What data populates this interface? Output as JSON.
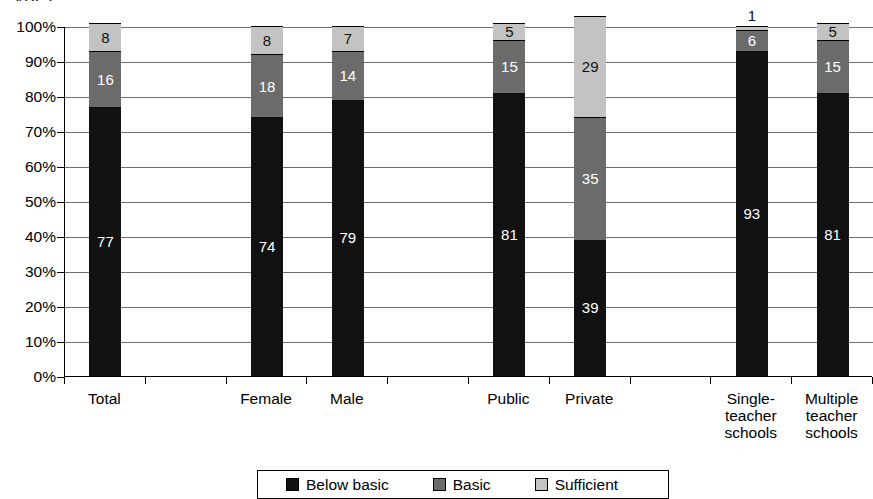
{
  "title_fragment": "ype)",
  "chart_data": {
    "type": "bar",
    "subtype": "stacked-100-percent",
    "title": "",
    "xlabel": "",
    "ylabel": "",
    "ylim": [
      0,
      100
    ],
    "ytick_labels": [
      "100%",
      "90%",
      "80%",
      "70%",
      "60%",
      "50%",
      "40%",
      "30%",
      "20%",
      "10%",
      "0%"
    ],
    "ytick_values": [
      100,
      90,
      80,
      70,
      60,
      50,
      40,
      30,
      20,
      10,
      0
    ],
    "grid": true,
    "legend_position": "bottom",
    "categories": [
      "Total",
      "Female",
      "Male",
      "Public",
      "Private",
      "Single-teacher schools",
      "Multiple teacher schools"
    ],
    "category_lines": [
      [
        "Total"
      ],
      [
        "Female"
      ],
      [
        "Male"
      ],
      [
        "Public"
      ],
      [
        "Private"
      ],
      [
        "Single-",
        "teacher",
        "schools"
      ],
      [
        "Multiple",
        "teacher",
        "schools"
      ]
    ],
    "series": [
      {
        "name": "Below basic",
        "color": "#111111",
        "values": [
          77,
          74,
          79,
          81,
          39,
          93,
          81
        ]
      },
      {
        "name": "Basic",
        "color": "#6b6b6b",
        "values": [
          16,
          18,
          14,
          15,
          35,
          6,
          15
        ]
      },
      {
        "name": "Sufficient",
        "color": "#c3c3c3",
        "values": [
          8,
          8,
          7,
          5,
          29,
          1,
          5
        ]
      }
    ],
    "legend_entries": [
      "Below basic",
      "Basic",
      "Sufficient"
    ],
    "bar_slots": [
      0,
      2,
      3,
      5,
      6,
      8,
      9
    ],
    "slot_count": 10,
    "label_outside": [
      {
        "category_index": 5,
        "series": "Sufficient",
        "value": 1
      }
    ]
  }
}
